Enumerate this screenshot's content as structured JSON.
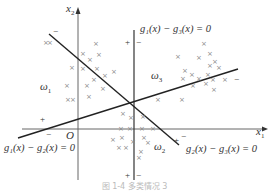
{
  "figure": {
    "axes": {
      "x_label": "x",
      "x_sub": "1",
      "y_label": "x",
      "y_sub": "2",
      "origin": "O"
    },
    "boundaries": [
      {
        "id": "g1-g3",
        "label": "g₁(x) − g₃(x) = 0",
        "plus_side": "+",
        "minus_side": "−"
      },
      {
        "id": "g1-g2",
        "label": "g₁(x) − g₂(x) = 0",
        "plus_side": "+",
        "minus_side": "−"
      },
      {
        "id": "g2-g3",
        "label": "g₂(x) − g₃(x) = 0",
        "plus_side": "+",
        "minus_side": "−"
      }
    ],
    "regions": [
      {
        "id": "omega1",
        "label": "ω",
        "sub": "1"
      },
      {
        "id": "omega2",
        "label": "ω",
        "sub": "2"
      },
      {
        "id": "omega3",
        "label": "ω",
        "sub": "3"
      }
    ],
    "sample_marker": "×",
    "caption": "图 1-4  多类情况 3"
  }
}
